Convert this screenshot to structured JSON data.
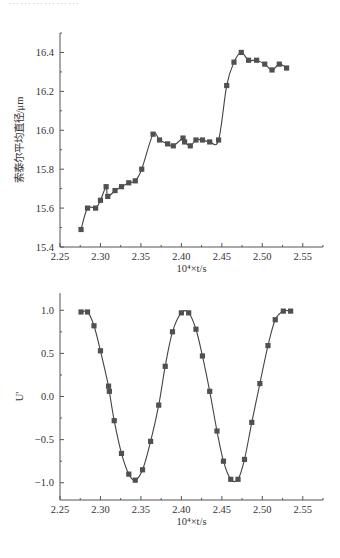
{
  "header_fragment": "………………",
  "chart_data": [
    {
      "type": "line",
      "title": "",
      "xlabel": "10⁴×t/s",
      "ylabel": "索泰尔平均直径/μm",
      "xlim": [
        2.25,
        2.575
      ],
      "ylim": [
        15.4,
        16.5
      ],
      "xticks": [
        "2.25",
        "2.30",
        "2.35",
        "2.40",
        "2.45",
        "2.50",
        "2.55"
      ],
      "yticks": [
        "15.4",
        "15.6",
        "15.8",
        "16.0",
        "16.2",
        "16.4"
      ],
      "grid": false,
      "legend": null,
      "marker": "square",
      "series": [
        {
          "name": "Sauter mean diameter",
          "x": [
            2.276,
            2.284,
            2.294,
            2.3,
            2.307,
            2.309,
            2.318,
            2.326,
            2.335,
            2.343,
            2.351,
            2.365,
            2.373,
            2.383,
            2.39,
            2.402,
            2.404,
            2.411,
            2.418,
            2.426,
            2.435,
            2.446,
            2.456,
            2.465,
            2.474,
            2.483,
            2.493,
            2.503,
            2.512,
            2.521,
            2.53
          ],
          "y": [
            15.49,
            15.6,
            15.6,
            15.64,
            15.71,
            15.66,
            15.69,
            15.71,
            15.73,
            15.74,
            15.8,
            15.98,
            15.95,
            15.93,
            15.92,
            15.96,
            15.94,
            15.92,
            15.95,
            15.95,
            15.94,
            15.95,
            16.23,
            16.35,
            16.4,
            16.36,
            16.36,
            16.34,
            16.31,
            16.34,
            16.32
          ]
        }
      ]
    },
    {
      "type": "line",
      "title": "",
      "xlabel": "10⁴×t/s",
      "ylabel": "U'",
      "xlim": [
        2.25,
        2.575
      ],
      "ylim": [
        -1.2,
        1.2
      ],
      "xticks": [
        "2.25",
        "2.30",
        "2.35",
        "2.40",
        "2.45",
        "2.50",
        "2.55"
      ],
      "yticks": [
        "−1.0",
        "−0.5",
        "0.0",
        "0.5",
        "1.0"
      ],
      "grid": false,
      "legend": null,
      "marker": "square",
      "series": [
        {
          "name": "U'",
          "x": [
            2.276,
            2.284,
            2.292,
            2.3,
            2.31,
            2.311,
            2.317,
            2.326,
            2.335,
            2.343,
            2.352,
            2.362,
            2.372,
            2.38,
            2.389,
            2.4,
            2.409,
            2.418,
            2.426,
            2.435,
            2.444,
            2.452,
            2.461,
            2.47,
            2.478,
            2.487,
            2.497,
            2.507,
            2.516,
            2.526,
            2.535
          ],
          "y": [
            0.98,
            0.98,
            0.82,
            0.53,
            0.12,
            0.06,
            -0.28,
            -0.66,
            -0.9,
            -0.97,
            -0.85,
            -0.52,
            -0.1,
            0.35,
            0.75,
            0.97,
            0.97,
            0.78,
            0.47,
            0.06,
            -0.4,
            -0.75,
            -0.96,
            -0.96,
            -0.73,
            -0.3,
            0.15,
            0.59,
            0.89,
            0.99,
            0.99
          ]
        }
      ]
    }
  ],
  "colors": {
    "axis": "#555555",
    "line": "#444444",
    "marker": "#505050",
    "text": "#333333"
  }
}
